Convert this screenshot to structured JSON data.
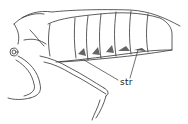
{
  "figure": {
    "labels": [
      {
        "text": "str"
      }
    ]
  }
}
